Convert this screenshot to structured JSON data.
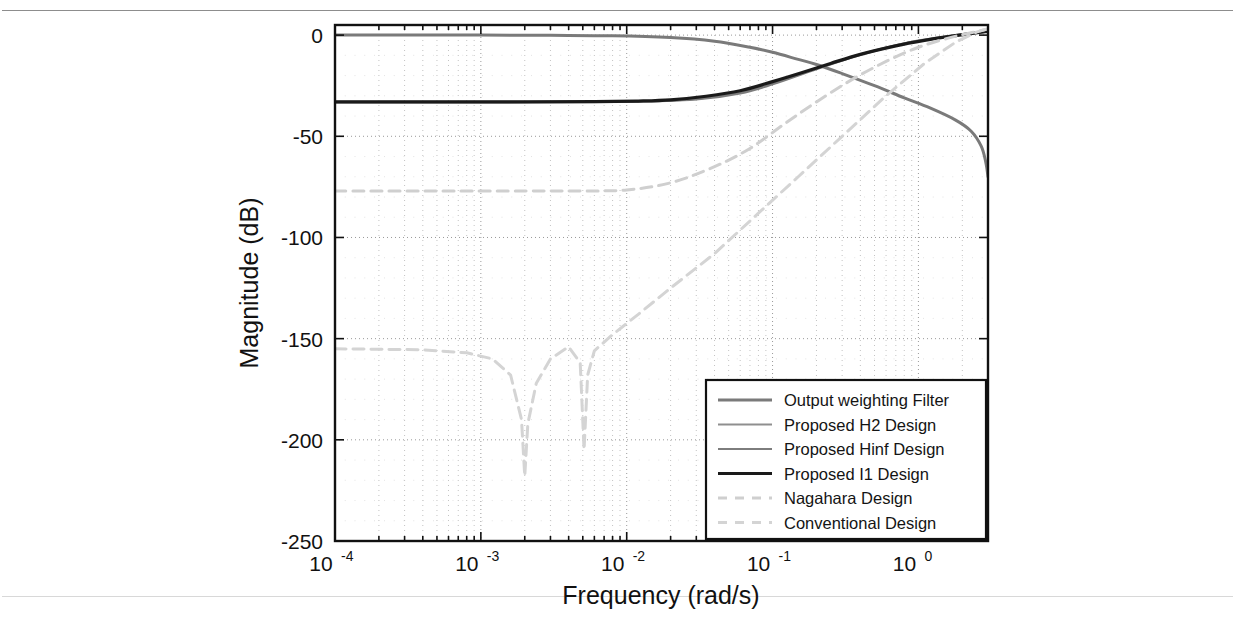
{
  "figure": {
    "background_color": "#ffffff",
    "frame_color": "#111111"
  },
  "axes": {
    "x_label": "Frequency  (rad/s)",
    "y_label": "Magnitude (dB)",
    "x_ticks": [
      {
        "mantissa": "10",
        "exponent": "-4",
        "value": 0.0001
      },
      {
        "mantissa": "10",
        "exponent": "-3",
        "value": 0.001
      },
      {
        "mantissa": "10",
        "exponent": "-2",
        "value": 0.01
      },
      {
        "mantissa": "10",
        "exponent": "-1",
        "value": 0.1
      },
      {
        "mantissa": "10",
        "exponent": "0",
        "value": 1
      }
    ],
    "y_ticks": [
      "0",
      "-50",
      "-100",
      "-150",
      "-200",
      "-250"
    ],
    "grid": "dotted"
  },
  "legend": {
    "position": "bottom-right-inside",
    "items": [
      {
        "label": "Output weighting Filter",
        "color": "#7a7a7a",
        "style": "solid",
        "width": 3.0
      },
      {
        "label": "Proposed H2 Design",
        "color": "#8f8f8f",
        "style": "solid",
        "width": 2.2
      },
      {
        "label": "Proposed Hinf Design",
        "color": "#7d7d7d",
        "style": "solid",
        "width": 2.2
      },
      {
        "label": "Proposed I1 Design",
        "color": "#1a1a1a",
        "style": "solid",
        "width": 3.2
      },
      {
        "label": "Nagahara Design",
        "color": "#cfcfcf",
        "style": "dashed",
        "width": 3.0
      },
      {
        "label": "Conventional Design",
        "color": "#d4d4d4",
        "style": "dashed",
        "width": 3.0
      }
    ]
  },
  "chart_data": {
    "type": "line",
    "title": "",
    "xlabel": "Frequency  (rad/s)",
    "ylabel": "Magnitude (dB)",
    "xscale": "log",
    "xlim": [
      0.0001,
      3.0
    ],
    "ylim": [
      -250,
      5
    ],
    "grid": true,
    "legend_position": "lower right",
    "series": [
      {
        "name": "Output weighting Filter",
        "color": "#7a7a7a",
        "style": "solid",
        "x": [
          0.0001,
          0.0003,
          0.001,
          0.003,
          0.008,
          0.02,
          0.04,
          0.07,
          0.1,
          0.15,
          0.2,
          0.3,
          0.5,
          0.8,
          1.2,
          1.8,
          2.3,
          2.7,
          2.9,
          3.0
        ],
        "y": [
          0.0,
          0.0,
          0.0,
          -0.1,
          -0.3,
          -1.2,
          -3.0,
          -6.0,
          -8.5,
          -12.0,
          -14.5,
          -19.0,
          -25.0,
          -31.0,
          -36.0,
          -42.0,
          -47.5,
          -55.0,
          -63.0,
          -70.0
        ]
      },
      {
        "name": "Proposed H2 Design",
        "color": "#8f8f8f",
        "style": "solid",
        "x": [
          0.0001,
          0.001,
          0.01,
          0.03,
          0.06,
          0.1,
          0.2,
          0.4,
          0.8,
          1.5,
          2.2,
          3.0
        ],
        "y": [
          -33.0,
          -33.0,
          -32.8,
          -31.5,
          -28.5,
          -24.0,
          -16.5,
          -9.5,
          -4.0,
          -0.8,
          0.8,
          1.8
        ]
      },
      {
        "name": "Proposed Hinf Design",
        "color": "#7d7d7d",
        "style": "solid",
        "x": [
          0.0001,
          0.001,
          0.01,
          0.03,
          0.06,
          0.1,
          0.2,
          0.4,
          0.8,
          1.5,
          2.2,
          3.0
        ],
        "y": [
          -33.2,
          -33.2,
          -33.0,
          -31.8,
          -28.8,
          -24.3,
          -16.8,
          -9.8,
          -4.2,
          -1.0,
          0.6,
          1.6
        ]
      },
      {
        "name": "Proposed I1 Design",
        "color": "#1a1a1a",
        "style": "solid",
        "x": [
          0.0001,
          0.0005,
          0.002,
          0.006,
          0.012,
          0.02,
          0.035,
          0.06,
          0.1,
          0.16,
          0.25,
          0.4,
          0.7,
          1.1,
          1.7,
          2.4,
          3.0
        ],
        "y": [
          -33.0,
          -33.0,
          -33.0,
          -32.9,
          -32.6,
          -32.0,
          -30.2,
          -27.5,
          -23.0,
          -18.5,
          -14.0,
          -9.5,
          -5.3,
          -2.6,
          -0.5,
          1.0,
          2.0
        ]
      },
      {
        "name": "Nagahara Design",
        "color": "#cfcfcf",
        "style": "dashed",
        "x": [
          0.0001,
          0.0005,
          0.002,
          0.005,
          0.01,
          0.02,
          0.04,
          0.07,
          0.12,
          0.2,
          0.35,
          0.6,
          1.0,
          1.6,
          2.3,
          3.0
        ],
        "y": [
          -77.0,
          -77.0,
          -77.0,
          -77.0,
          -76.5,
          -73.0,
          -65.0,
          -56.0,
          -44.0,
          -33.0,
          -22.0,
          -13.0,
          -6.0,
          -1.5,
          1.2,
          3.0
        ]
      },
      {
        "name": "Conventional Design",
        "color": "#d4d4d4",
        "style": "dashed",
        "x": [
          0.0001,
          0.0004,
          0.0008,
          0.0012,
          0.0016,
          0.0019,
          0.002,
          0.0021,
          0.0024,
          0.003,
          0.004,
          0.0048,
          0.0051,
          0.0054,
          0.006,
          0.008,
          0.012,
          0.02,
          0.04,
          0.08,
          0.15,
          0.3,
          0.6,
          1.1,
          1.8,
          2.5,
          3.0
        ],
        "y": [
          -155.0,
          -155.5,
          -157.0,
          -160.0,
          -168.0,
          -190.0,
          -218.0,
          -192.0,
          -172.0,
          -160.0,
          -154.0,
          -162.0,
          -205.0,
          -168.0,
          -156.0,
          -148.0,
          -138.0,
          -125.0,
          -108.0,
          -88.0,
          -70.0,
          -50.0,
          -30.0,
          -14.0,
          -3.5,
          1.5,
          3.2
        ]
      }
    ]
  }
}
